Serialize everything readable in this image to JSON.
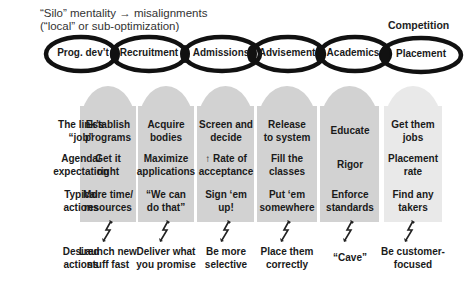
{
  "title": {
    "line1": "“Silo” mentality → misalignments",
    "line2": "(“local” or sub-optimization)"
  },
  "competition_label": "Competition",
  "chain_links": [
    {
      "label": "Prog. dev’t"
    },
    {
      "label": "Recruitment"
    },
    {
      "label": "Admissions"
    },
    {
      "label": "Advisement"
    },
    {
      "label": "Academics"
    },
    {
      "label": "Placement"
    }
  ],
  "row_labels": [
    {
      "line1": "The link’s",
      "line2": "“job”"
    },
    {
      "line1": "Agenda/",
      "line2": "expectation"
    },
    {
      "line1": "Typical",
      "line2": "actions"
    },
    {
      "line1": "Desired",
      "line2": "actions"
    }
  ],
  "columns": [
    {
      "job": {
        "line1": "Establish",
        "line2": "programs"
      },
      "agenda": {
        "line1": "Get it",
        "line2": "right"
      },
      "typical": {
        "line1": "More time/",
        "line2": "resources"
      },
      "desired": {
        "line1": "Launch new",
        "line2": "stuff fast"
      }
    },
    {
      "job": {
        "line1": "Acquire",
        "line2": "bodies"
      },
      "agenda": {
        "line1": "Maximize",
        "line2": "applications"
      },
      "typical": {
        "line1": "“We can",
        "line2": "do that”"
      },
      "desired": {
        "line1": "Deliver what",
        "line2": "you promise"
      }
    },
    {
      "job": {
        "line1": "Screen and",
        "line2": "decide"
      },
      "agenda": {
        "line1": "↑ Rate of",
        "line2": "acceptance"
      },
      "typical": {
        "line1": "Sign ‘em",
        "line2": "up!"
      },
      "desired": {
        "line1": "Be more",
        "line2": "selective"
      }
    },
    {
      "job": {
        "line1": "Release",
        "line2": "to system"
      },
      "agenda": {
        "line1": "Fill the",
        "line2": "classes"
      },
      "typical": {
        "line1": "Put ‘em",
        "line2": "somewhere"
      },
      "desired": {
        "line1": "Place them",
        "line2": "correctly"
      }
    },
    {
      "job": {
        "line1": "Educate",
        "line2": ""
      },
      "agenda": {
        "line1": "Rigor",
        "line2": ""
      },
      "typical": {
        "line1": "Enforce",
        "line2": "standards"
      },
      "desired": {
        "line1": "“Cave”",
        "line2": ""
      }
    },
    {
      "job": {
        "line1": "Get them",
        "line2": "jobs"
      },
      "agenda": {
        "line1": "Placement",
        "line2": "rate"
      },
      "typical": {
        "line1": "Find any",
        "line2": "takers"
      },
      "desired": {
        "line1": "Be customer-",
        "line2": "focused"
      }
    }
  ],
  "colors": {
    "column_fill": "#d2d2d2",
    "column_fill_last": "#e9e9e9",
    "chain_stroke": "#111111",
    "text": "#1a1a1a"
  }
}
